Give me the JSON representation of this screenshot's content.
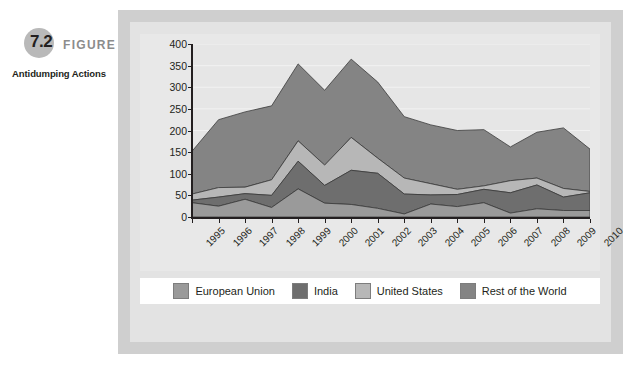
{
  "figure": {
    "number": "7.2",
    "word": "FIGURE",
    "title": "Antidumping Actions"
  },
  "chart_data": {
    "type": "area",
    "stacked": true,
    "title": "Antidumping Actions",
    "xlabel": "",
    "ylabel": "",
    "ylim": [
      0,
      400
    ],
    "ytick_step": 50,
    "yticks": [
      "400",
      "350",
      "300",
      "250",
      "200",
      "150",
      "100",
      "50",
      "0"
    ],
    "grid": true,
    "legend_position": "bottom",
    "categories": [
      "1995",
      "1996",
      "1997",
      "1998",
      "1999",
      "2000",
      "2001",
      "2002",
      "2003",
      "2004",
      "2005",
      "2006",
      "2007",
      "2008",
      "2009",
      "2010"
    ],
    "series": [
      {
        "name": "European Union",
        "color": "#9a9a9a",
        "values": [
          33,
          25,
          41,
          22,
          65,
          32,
          29,
          20,
          7,
          30,
          24,
          33,
          9,
          19,
          15,
          15
        ]
      },
      {
        "name": "India",
        "color": "#6e6e6e",
        "values": [
          6,
          21,
          13,
          28,
          64,
          41,
          79,
          81,
          46,
          21,
          28,
          31,
          47,
          55,
          31,
          41
        ]
      },
      {
        "name": "United States",
        "color": "#b7b7b7",
        "values": [
          14,
          22,
          15,
          36,
          47,
          47,
          76,
          35,
          37,
          26,
          12,
          8,
          28,
          16,
          20,
          3
        ]
      },
      {
        "name": "Rest of the World",
        "color": "#848484",
        "values": [
          99,
          157,
          174,
          171,
          178,
          173,
          181,
          176,
          142,
          136,
          136,
          130,
          78,
          106,
          140,
          98
        ]
      }
    ],
    "totals": [
      152,
      225,
      243,
      257,
      354,
      293,
      365,
      312,
      232,
      213,
      200,
      202,
      162,
      196,
      206,
      157
    ]
  },
  "legend": {
    "items": [
      {
        "label": "European Union",
        "color": "#9a9a9a"
      },
      {
        "label": "India",
        "color": "#6e6e6e"
      },
      {
        "label": "United States",
        "color": "#b7b7b7"
      },
      {
        "label": "Rest of the World",
        "color": "#848484"
      }
    ]
  },
  "colors": {
    "outer_panel": "#cfcfcf",
    "inner_panel": "#e3e3e3",
    "chart_card": "#e8e8e8",
    "plot_background": "#e6e6e6",
    "gridline": "#f2f2f2",
    "axis": "#231f20",
    "legend_background": "#ffffff",
    "badge_circle": "#b9b9b9",
    "figure_word": "#8c8c8c"
  }
}
